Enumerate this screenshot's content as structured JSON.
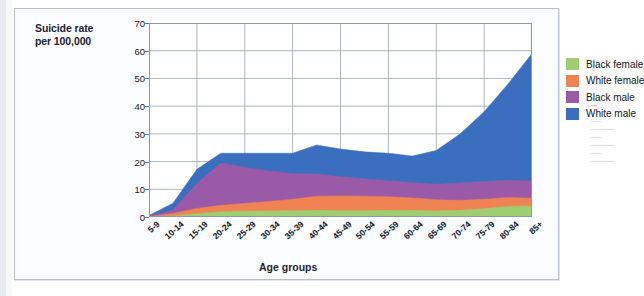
{
  "figure": {
    "y_axis_title": "Suicide rate per 100,000",
    "y_axis_title_line1": "Suicide rate",
    "y_axis_title_line2": "per 100,000",
    "x_axis_title": "Age groups"
  },
  "legend": {
    "items": [
      {
        "label": "Black female",
        "color": "#9fce72"
      },
      {
        "label": "White female",
        "color": "#ef8354"
      },
      {
        "label": "Black male",
        "color": "#9b5aa8"
      },
      {
        "label": "White male",
        "color": "#3a6fc0"
      }
    ]
  },
  "chart_data": {
    "type": "area",
    "stacked": true,
    "title": "",
    "xlabel": "Age groups",
    "ylabel": "Suicide rate per 100,000",
    "ylim": [
      0,
      70
    ],
    "yticks": [
      0,
      10,
      20,
      30,
      40,
      50,
      60,
      70
    ],
    "grid": true,
    "legend_position": "inside-top-right",
    "categories": [
      "5-9",
      "10-14",
      "15-19",
      "20-24",
      "25-29",
      "30-34",
      "35-39",
      "40-44",
      "45-49",
      "50-54",
      "55-59",
      "60-64",
      "65-69",
      "70-74",
      "75-79",
      "80-84",
      "85+"
    ],
    "series": [
      {
        "name": "Black female",
        "color": "#9fce72",
        "values": [
          0.1,
          0.4,
          1.2,
          1.9,
          2.1,
          2.2,
          2.3,
          2.4,
          2.3,
          2.3,
          2.4,
          2.4,
          2.2,
          2.4,
          3.0,
          3.8,
          4.0
        ]
      },
      {
        "name": "White female",
        "color": "#ef8354",
        "values": [
          0.1,
          0.9,
          1.9,
          2.3,
          2.8,
          3.4,
          4.1,
          5.1,
          5.3,
          5.2,
          4.9,
          4.5,
          4.0,
          3.6,
          3.4,
          3.2,
          2.8
        ]
      },
      {
        "name": "Black male",
        "color": "#9b5aa8",
        "values": [
          0.1,
          1.3,
          9.0,
          15.3,
          13.0,
          11.0,
          9.2,
          8.0,
          6.9,
          6.3,
          5.8,
          5.5,
          5.6,
          6.3,
          6.4,
          6.3,
          6.2
        ]
      },
      {
        "name": "White male",
        "color": "#3a6fc0",
        "values": [
          0.2,
          2.4,
          5.1,
          3.5,
          5.1,
          6.4,
          7.4,
          10.5,
          10.0,
          9.7,
          9.9,
          9.6,
          12.2,
          17.7,
          25.2,
          34.7,
          46.0
        ]
      }
    ],
    "totals": [
      0.5,
      5.0,
      17.2,
      23.0,
      23.0,
      23.0,
      23.0,
      26.0,
      24.5,
      23.5,
      23.0,
      22.0,
      24.0,
      30.0,
      38.0,
      48.0,
      59.0
    ]
  }
}
